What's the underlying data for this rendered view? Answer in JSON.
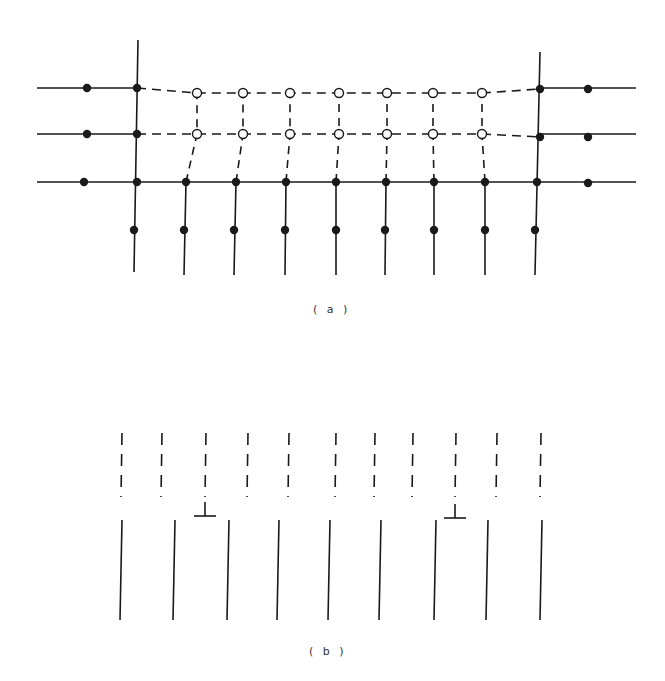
{
  "figure": {
    "panel_a": {
      "label": "( a )",
      "description": "Lattice with filled (solid) atoms and open (vacancy/displaced) sites connected by solid and dashed bonds",
      "solid_rows": [
        {
          "y": 88,
          "segments": [
            [
              37,
              137
            ],
            [
              540,
              636
            ]
          ]
        },
        {
          "y": 134,
          "segments": [
            [
              37,
              137
            ],
            [
              540,
              636
            ]
          ]
        },
        {
          "y": 182,
          "segments": [
            [
              37,
              636
            ]
          ]
        }
      ],
      "dashed_rows": [
        {
          "y": 93,
          "from": 137,
          "to": 540
        },
        {
          "y": 134,
          "from": 137,
          "to": 540
        }
      ],
      "open_circle_columns_x": [
        197,
        243,
        290,
        339,
        387,
        433,
        482
      ],
      "open_circle_rows_y": [
        93,
        134
      ],
      "filled_dots": {
        "left_column": [
          [
            87,
            88
          ],
          [
            87,
            134
          ],
          [
            84,
            182
          ]
        ],
        "right_column": [
          [
            588,
            89
          ],
          [
            588,
            137
          ],
          [
            588,
            183
          ]
        ],
        "junctions": [
          [
            137,
            88
          ],
          [
            137,
            134
          ],
          [
            540,
            89
          ],
          [
            540,
            137
          ]
        ],
        "bottom_row_y": 182,
        "bottom_row_x": [
          137,
          186,
          236,
          286,
          336,
          386,
          434,
          485,
          537
        ],
        "lower_row_y": 230,
        "lower_row_x": [
          134,
          184,
          234,
          285,
          336,
          385,
          434,
          485,
          535
        ]
      },
      "vertical_lines": {
        "outer_left": {
          "x_top": 138,
          "x_bottom": 134,
          "y_top": 40,
          "y_bottom": 272
        },
        "outer_right": {
          "x_top": 540,
          "x_bottom": 535,
          "y_top": 52,
          "y_bottom": 275
        },
        "inner_x_bottom": [
          184,
          234,
          285,
          336,
          385,
          434,
          485
        ],
        "inner_y_from": 182,
        "inner_y_to": 275
      }
    },
    "panel_b": {
      "label": "( b )",
      "description": "Dashed (upper) and solid (lower) lattice plane traces with two edge dislocation symbols",
      "dashed_lines_x": [
        122,
        162,
        206,
        248,
        289,
        336,
        375,
        413,
        456,
        497,
        541
      ],
      "dashed_y": [
        433,
        497
      ],
      "solid_lines_x": [
        121,
        174,
        228,
        278,
        329,
        380,
        435,
        487,
        541
      ],
      "solid_y": [
        520,
        620
      ],
      "dislocations": [
        {
          "x": 205,
          "y": 516,
          "symbol": "⊥"
        },
        {
          "x": 455,
          "y": 518,
          "symbol": "⊥"
        }
      ]
    },
    "colors": {
      "ink": "#1a1a1a",
      "background": "#ffffff"
    }
  }
}
